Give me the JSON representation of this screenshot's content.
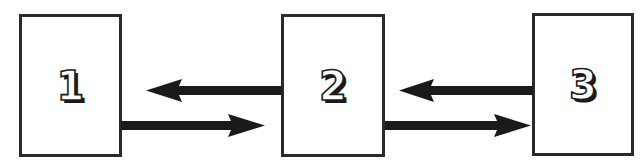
{
  "diagram": {
    "nodes": [
      {
        "id": "1",
        "label": "1"
      },
      {
        "id": "2",
        "label": "2"
      },
      {
        "id": "3",
        "label": "3"
      }
    ],
    "edges": [
      {
        "from": "2",
        "to": "1",
        "direction": "left"
      },
      {
        "from": "1",
        "to": "2",
        "direction": "right"
      },
      {
        "from": "3",
        "to": "2",
        "direction": "left"
      },
      {
        "from": "2",
        "to": "3",
        "direction": "right"
      }
    ],
    "colors": {
      "stroke": "#1a1a1a",
      "fill": "#ffffff"
    }
  }
}
